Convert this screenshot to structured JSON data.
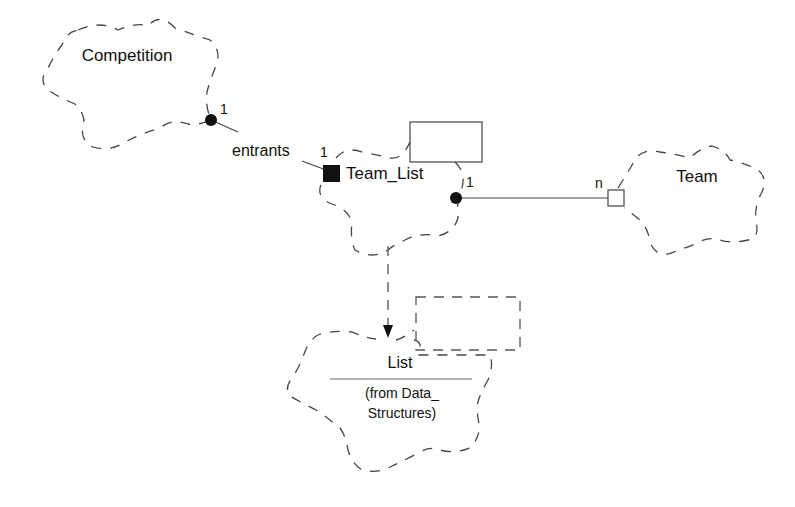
{
  "diagram": {
    "type": "Booch class diagram",
    "classes": [
      {
        "id": "competition",
        "name": "Competition"
      },
      {
        "id": "team_list",
        "name": "Team_List",
        "parameterized": true
      },
      {
        "id": "team",
        "name": "Team"
      },
      {
        "id": "list",
        "name": "List",
        "subtitle_line1": "(from Data_",
        "subtitle_line2": "Structures)",
        "parameterized": true
      }
    ],
    "associations": [
      {
        "from": "Competition",
        "to": "Team_List",
        "role": "entrants",
        "from_multiplicity": "1",
        "to_multiplicity": "1",
        "from_adornment": "filled-circle",
        "to_adornment": "filled-square"
      },
      {
        "from": "Team_List",
        "to": "Team",
        "from_multiplicity": "1",
        "to_multiplicity": "n",
        "from_adornment": "filled-circle",
        "to_adornment": "hollow-square"
      }
    ],
    "instantiation": {
      "from": "Team_List",
      "to": "List",
      "style": "dashed-arrow"
    }
  },
  "colors": {
    "stroke": "#444444",
    "text": "#111111",
    "background": "#ffffff"
  }
}
